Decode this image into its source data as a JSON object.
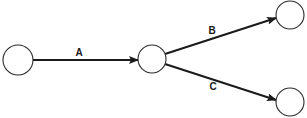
{
  "diagram": {
    "type": "activity-network",
    "colors": {
      "stroke": "#1a1a1a",
      "node_fill": "#ffffff",
      "background": "#ffffff"
    },
    "nodes": [
      {
        "id": "n1",
        "cx": 18,
        "cy": 60,
        "r": 15
      },
      {
        "id": "n2",
        "cx": 152,
        "cy": 59,
        "r": 14
      },
      {
        "id": "n3",
        "cx": 290,
        "cy": 15,
        "r": 14
      },
      {
        "id": "n4",
        "cx": 290,
        "cy": 102,
        "r": 14
      }
    ],
    "edges": [
      {
        "id": "A",
        "label": "A",
        "from": "n1",
        "to": "n2",
        "x1": 33,
        "y1": 60,
        "x2": 138,
        "y2": 60,
        "label_x": 79,
        "label_y": 53
      },
      {
        "id": "B",
        "label": "B",
        "from": "n2",
        "to": "n3",
        "x1": 165,
        "y1": 54,
        "x2": 276,
        "y2": 18,
        "label_x": 212,
        "label_y": 31
      },
      {
        "id": "C",
        "label": "C",
        "from": "n2",
        "to": "n4",
        "x1": 165,
        "y1": 64,
        "x2": 276,
        "y2": 100,
        "label_x": 213,
        "label_y": 87
      }
    ]
  }
}
